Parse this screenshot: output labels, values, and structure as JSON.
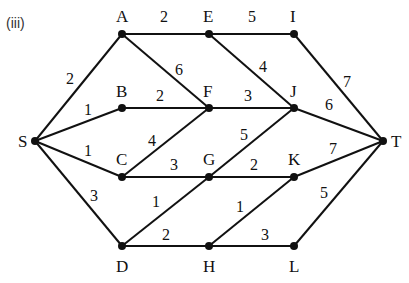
{
  "part_label": "(iii)",
  "nodes": [
    {
      "id": "S",
      "x": 35,
      "y": 141,
      "lx": 18,
      "ly": 147
    },
    {
      "id": "A",
      "x": 122,
      "y": 34,
      "lx": 116,
      "ly": 22
    },
    {
      "id": "B",
      "x": 122,
      "y": 108,
      "lx": 116,
      "ly": 97
    },
    {
      "id": "C",
      "x": 122,
      "y": 177,
      "lx": 116,
      "ly": 165
    },
    {
      "id": "D",
      "x": 122,
      "y": 246,
      "lx": 116,
      "ly": 272
    },
    {
      "id": "E",
      "x": 209,
      "y": 34,
      "lx": 203,
      "ly": 22
    },
    {
      "id": "F",
      "x": 209,
      "y": 108,
      "lx": 203,
      "ly": 97
    },
    {
      "id": "G",
      "x": 209,
      "y": 177,
      "lx": 203,
      "ly": 165
    },
    {
      "id": "H",
      "x": 209,
      "y": 246,
      "lx": 203,
      "ly": 272
    },
    {
      "id": "I",
      "x": 294,
      "y": 34,
      "lx": 290,
      "ly": 22
    },
    {
      "id": "J",
      "x": 294,
      "y": 108,
      "lx": 290,
      "ly": 97
    },
    {
      "id": "K",
      "x": 294,
      "y": 177,
      "lx": 288,
      "ly": 165
    },
    {
      "id": "L",
      "x": 294,
      "y": 246,
      "lx": 289,
      "ly": 272
    },
    {
      "id": "T",
      "x": 383,
      "y": 141,
      "lx": 391,
      "ly": 147
    }
  ],
  "edges": [
    {
      "from": "S",
      "to": "A",
      "w": "2",
      "wx": 66,
      "wy": 84
    },
    {
      "from": "S",
      "to": "B",
      "w": "1",
      "wx": 84,
      "wy": 115
    },
    {
      "from": "S",
      "to": "C",
      "w": "1",
      "wx": 84,
      "wy": 156
    },
    {
      "from": "S",
      "to": "D",
      "w": "3",
      "wx": 90,
      "wy": 201
    },
    {
      "from": "A",
      "to": "E",
      "w": "2",
      "wx": 160,
      "wy": 22
    },
    {
      "from": "A",
      "to": "F",
      "w": "6",
      "wx": 175,
      "wy": 75
    },
    {
      "from": "B",
      "to": "F",
      "w": "2",
      "wx": 156,
      "wy": 101
    },
    {
      "from": "C",
      "to": "F",
      "w": "4",
      "wx": 148,
      "wy": 146
    },
    {
      "from": "C",
      "to": "G",
      "w": "3",
      "wx": 170,
      "wy": 170
    },
    {
      "from": "D",
      "to": "G",
      "w": "1",
      "wx": 152,
      "wy": 207
    },
    {
      "from": "D",
      "to": "H",
      "w": "2",
      "wx": 162,
      "wy": 240
    },
    {
      "from": "E",
      "to": "I",
      "w": "5",
      "wx": 248,
      "wy": 22
    },
    {
      "from": "E",
      "to": "J",
      "w": "4",
      "wx": 259,
      "wy": 72
    },
    {
      "from": "F",
      "to": "J",
      "w": "3",
      "wx": 244,
      "wy": 101
    },
    {
      "from": "G",
      "to": "J",
      "w": "5",
      "wx": 240,
      "wy": 140
    },
    {
      "from": "G",
      "to": "K",
      "w": "2",
      "wx": 250,
      "wy": 170
    },
    {
      "from": "H",
      "to": "K",
      "w": "1",
      "wx": 236,
      "wy": 212
    },
    {
      "from": "H",
      "to": "L",
      "w": "3",
      "wx": 261,
      "wy": 240
    },
    {
      "from": "I",
      "to": "T",
      "w": "7",
      "wx": 343,
      "wy": 87
    },
    {
      "from": "J",
      "to": "T",
      "w": "6",
      "wx": 325,
      "wy": 110
    },
    {
      "from": "K",
      "to": "T",
      "w": "7",
      "wx": 329,
      "wy": 154
    },
    {
      "from": "L",
      "to": "T",
      "w": "5",
      "wx": 320,
      "wy": 198
    }
  ]
}
